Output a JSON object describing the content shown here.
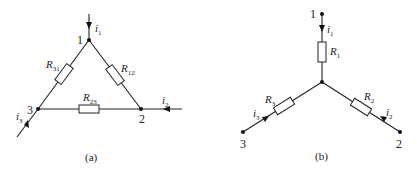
{
  "diagram_a": {
    "caption": "(a)",
    "type": "delta",
    "nodes": {
      "n1": "1",
      "n2": "2",
      "n3": "3"
    },
    "resistors": {
      "r31": {
        "base": "R",
        "sub": "31"
      },
      "r12": {
        "base": "R",
        "sub": "12"
      },
      "r23": {
        "base": "R",
        "sub": "23"
      }
    },
    "currents": {
      "i1": {
        "base": "i",
        "sub": "1"
      },
      "i2": {
        "base": "i",
        "sub": "2"
      },
      "i3": {
        "base": "i",
        "sub": "3"
      }
    }
  },
  "diagram_b": {
    "caption": "(b)",
    "type": "wye",
    "nodes": {
      "n1": "1",
      "n2": "2",
      "n3": "3"
    },
    "resistors": {
      "r1": {
        "base": "R",
        "sub": "1"
      },
      "r2": {
        "base": "R",
        "sub": "2"
      },
      "r3": {
        "base": "R",
        "sub": "3"
      }
    },
    "currents": {
      "i1": {
        "base": "i",
        "sub": "1"
      },
      "i2": {
        "base": "i",
        "sub": "2"
      },
      "i3": {
        "base": "i",
        "sub": "3"
      }
    }
  }
}
